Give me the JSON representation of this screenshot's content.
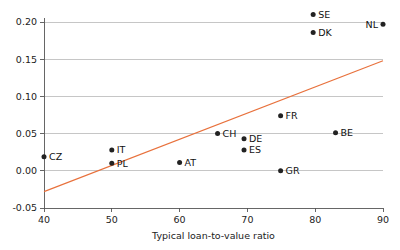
{
  "chart_data": {
    "type": "scatter",
    "title": "",
    "xlabel": "Typical loan-to-value ratio",
    "ylabel": "",
    "xlim": [
      40,
      90
    ],
    "ylim": [
      -0.05,
      0.215
    ],
    "grid": true,
    "legend": "none",
    "xticks": [
      40,
      50,
      60,
      70,
      80,
      90
    ],
    "xtick_labels": [
      "40",
      "50",
      "60",
      "70",
      "80",
      "90"
    ],
    "yticks": [
      -0.05,
      0.0,
      0.05,
      0.1,
      0.15,
      0.2
    ],
    "ytick_labels": [
      "-0.05",
      "0.00",
      "0.05",
      "0.10",
      "0.15",
      "0.20"
    ],
    "point_color": "#222222",
    "trend_color": "#e8713c",
    "grid_color": "#b8b8b8",
    "points": [
      {
        "label": "CZ",
        "x": 40.0,
        "y": 0.019,
        "label_side": "right"
      },
      {
        "label": "PL",
        "x": 50.0,
        "y": 0.01,
        "label_side": "right"
      },
      {
        "label": "IT",
        "x": 50.0,
        "y": 0.028,
        "label_side": "right"
      },
      {
        "label": "AT",
        "x": 60.0,
        "y": 0.011,
        "label_side": "right"
      },
      {
        "label": "CH",
        "x": 65.6,
        "y": 0.05,
        "label_side": "right"
      },
      {
        "label": "DE",
        "x": 69.5,
        "y": 0.043,
        "label_side": "right"
      },
      {
        "label": "ES",
        "x": 69.5,
        "y": 0.028,
        "label_side": "right"
      },
      {
        "label": "GR",
        "x": 74.9,
        "y": 0.0,
        "label_side": "right"
      },
      {
        "label": "FR",
        "x": 74.9,
        "y": 0.074,
        "label_side": "right"
      },
      {
        "label": "BE",
        "x": 83.0,
        "y": 0.051,
        "label_side": "right"
      },
      {
        "label": "DK",
        "x": 79.7,
        "y": 0.186,
        "label_side": "right"
      },
      {
        "label": "SE",
        "x": 79.7,
        "y": 0.21,
        "label_side": "right"
      },
      {
        "label": "NL",
        "x": 90.0,
        "y": 0.197,
        "label_side": "left"
      }
    ],
    "trend": {
      "x1": 40.0,
      "y1": -0.028,
      "x2": 90.0,
      "y2": 0.148
    }
  }
}
